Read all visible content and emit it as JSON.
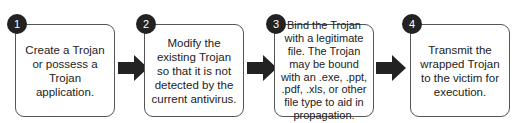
{
  "steps": [
    {
      "number": "1",
      "text": "Create a Trojan or possess a Trojan application."
    },
    {
      "number": "2",
      "text": "Modify the existing Trojan so that it is not detected by the current antivirus."
    },
    {
      "number": "3",
      "text": "Bind the Trojan with a legitimate file. The Trojan may be bound with an .exe, .ppt, .pdf, .xls, or other file type to aid in propagation."
    },
    {
      "number": "4",
      "text": "Transmit the wrapped Trojan to the victim for execution."
    }
  ],
  "colors": {
    "badge": "#222222",
    "arrow": "#222222",
    "border": "#555555"
  }
}
